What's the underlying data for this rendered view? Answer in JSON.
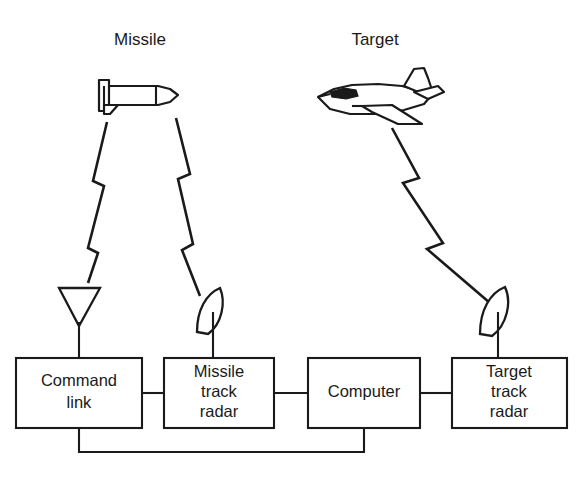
{
  "figure": {
    "background_color": "#ffffff",
    "line_color": "#1a1a1a"
  },
  "top_labels": {
    "missile": "Missile",
    "target": "Target"
  },
  "vehicles": [
    {
      "name": "missile-icon",
      "label": "Missile",
      "heading": "right"
    },
    {
      "name": "aircraft-icon",
      "label": "Target",
      "heading": "left"
    }
  ],
  "antennas": [
    {
      "name": "command-link-antenna",
      "type": "horn",
      "attached_to": "Command link"
    },
    {
      "name": "missile-track-dish",
      "type": "parabolic-dish",
      "attached_to": "Missile track radar"
    },
    {
      "name": "target-track-dish",
      "type": "parabolic-dish",
      "attached_to": "Target track radar"
    }
  ],
  "signal_links": [
    {
      "name": "command-link-to-missile",
      "from": "Command link",
      "to": "Missile",
      "style": "lightning"
    },
    {
      "name": "missile-track-radar-to-missile",
      "from": "Missile track radar",
      "to": "Missile",
      "style": "lightning"
    },
    {
      "name": "target-track-radar-to-target",
      "from": "Target track radar",
      "to": "Target",
      "style": "lightning"
    }
  ],
  "blocks": [
    {
      "name": "command-link",
      "lines": [
        "Command",
        "link"
      ],
      "line1": "Command",
      "line2": "link",
      "line3": ""
    },
    {
      "name": "missile-track-radar",
      "lines": [
        "Missile",
        "track",
        "radar"
      ],
      "line1": "Missile",
      "line2": "track",
      "line3": "radar"
    },
    {
      "name": "computer",
      "lines": [
        "Computer"
      ],
      "line1": "Computer",
      "line2": "",
      "line3": ""
    },
    {
      "name": "target-track-radar",
      "lines": [
        "Target",
        "track",
        "radar"
      ],
      "line1": "Target",
      "line2": "track",
      "line3": "radar"
    }
  ],
  "connections": [
    {
      "name": "command-link-to-missile-track-radar",
      "from": "Command link",
      "to": "Missile track radar",
      "style": "solid"
    },
    {
      "name": "missile-track-radar-to-computer",
      "from": "Missile track radar",
      "to": "Computer",
      "style": "solid"
    },
    {
      "name": "computer-to-target-track-radar",
      "from": "Computer",
      "to": "Target track radar",
      "style": "solid"
    },
    {
      "name": "computer-to-command-link-feedback",
      "from": "Computer",
      "to": "Command link",
      "style": "solid-routed-below"
    }
  ],
  "caption": ""
}
